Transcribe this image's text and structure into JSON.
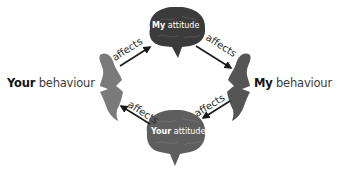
{
  "diagram": {
    "type": "cycle",
    "nodes": {
      "your_behaviour": {
        "bold": "Your",
        "rest": " behaviour"
      },
      "my_attitude": {
        "bold": "My",
        "rest": " attitude"
      },
      "my_behaviour": {
        "bold": "My",
        "rest": " behaviour"
      },
      "your_attitude": {
        "bold": "Your",
        "rest": " attitude"
      }
    },
    "edges": [
      {
        "from": "your_behaviour",
        "to": "my_attitude",
        "label": "affects"
      },
      {
        "from": "my_attitude",
        "to": "my_behaviour",
        "label": "affects"
      },
      {
        "from": "my_behaviour",
        "to": "your_attitude",
        "label": "affects"
      },
      {
        "from": "your_attitude",
        "to": "your_behaviour",
        "label": "affects"
      }
    ],
    "colors": {
      "brain_top": "#3b3b3b",
      "brain_bottom": "#5e5e5e",
      "head_left": "#7a7a7a",
      "head_right": "#555555",
      "arrow": "#1a1a1a"
    }
  }
}
